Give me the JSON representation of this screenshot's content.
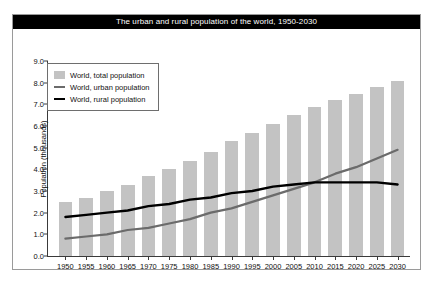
{
  "title": "The urban and rural population of the world, 1950-2030",
  "colors": {
    "bar": "#c3c3c3",
    "urban_line": "#6b6b6b",
    "rural_line": "#000000",
    "title_bar_bg": "#000000",
    "title_text": "#ffffff",
    "frame": "#9a9a9a"
  },
  "legend": {
    "position": "top-left-inside",
    "items": [
      {
        "label": "World, total population",
        "marker": "bar-swatch"
      },
      {
        "label": "World, urban population",
        "marker": "line-swatch"
      },
      {
        "label": "World, rural population",
        "marker": "line-swatch"
      }
    ]
  },
  "chart_data": {
    "type": "bar",
    "title": "The urban and rural population of the world, 1950-2030",
    "xlabel": "",
    "ylabel": "Population (thousands)",
    "categories": [
      "1950",
      "1955",
      "1960",
      "1965",
      "1970",
      "1975",
      "1980",
      "1985",
      "1990",
      "1995",
      "2000",
      "2005",
      "2010",
      "2015",
      "2020",
      "2025",
      "2030"
    ],
    "ylim": [
      0.0,
      9.0
    ],
    "yticks": [
      "0.0",
      "1.0",
      "2.0",
      "3.0",
      "4.0",
      "5.0",
      "6.0",
      "7.0",
      "8.0",
      "9.0"
    ],
    "grid": false,
    "series": [
      {
        "name": "World, total population",
        "type": "bar",
        "values": [
          2.5,
          2.7,
          3.0,
          3.3,
          3.7,
          4.0,
          4.4,
          4.8,
          5.3,
          5.7,
          6.1,
          6.5,
          6.9,
          7.2,
          7.5,
          7.8,
          8.1
        ]
      },
      {
        "name": "World, urban population",
        "type": "line",
        "values": [
          0.8,
          0.9,
          1.0,
          1.2,
          1.3,
          1.5,
          1.7,
          2.0,
          2.2,
          2.5,
          2.8,
          3.1,
          3.4,
          3.8,
          4.1,
          4.5,
          4.9
        ]
      },
      {
        "name": "World, rural population",
        "type": "line",
        "values": [
          1.8,
          1.9,
          2.0,
          2.1,
          2.3,
          2.4,
          2.6,
          2.7,
          2.9,
          3.0,
          3.2,
          3.3,
          3.4,
          3.4,
          3.4,
          3.4,
          3.3
        ]
      }
    ]
  }
}
